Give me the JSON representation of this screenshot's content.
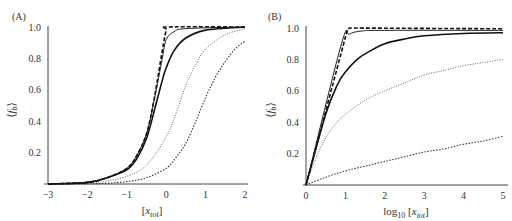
{
  "chart_data": [
    {
      "type": "line",
      "panel_label": "(A)",
      "xlabel": "[x_tot]",
      "ylabel": "⟨f_b⟩",
      "xlim": [
        -3,
        2
      ],
      "ylim": [
        0,
        1.0
      ],
      "xticks": [
        "−3",
        "−2",
        "−1",
        "0",
        "1",
        "2"
      ],
      "yticks": [
        "0.2",
        "0.4",
        "0.6",
        "0.8",
        "1.0"
      ],
      "grid": false,
      "legend": null,
      "series": [
        {
          "name": "dashed (limit)",
          "style": "dashed-thick",
          "x": [
            -3,
            -2,
            -1.5,
            -1,
            -0.75,
            -0.5,
            -0.3,
            -0.1,
            0,
            0.05,
            2
          ],
          "y": [
            0,
            0.01,
            0.04,
            0.1,
            0.18,
            0.32,
            0.55,
            0.85,
            0.98,
            1.0,
            1.0
          ]
        },
        {
          "name": "solid thin",
          "style": "solid-thin",
          "x": [
            -3,
            -2,
            -1.5,
            -1,
            -0.75,
            -0.5,
            -0.3,
            -0.1,
            0,
            0.2,
            0.5,
            2
          ],
          "y": [
            0,
            0.01,
            0.04,
            0.1,
            0.18,
            0.32,
            0.54,
            0.8,
            0.92,
            0.97,
            0.99,
            1.0
          ]
        },
        {
          "name": "solid thick",
          "style": "solid-thick",
          "x": [
            -3,
            -2,
            -1.5,
            -1,
            -0.75,
            -0.5,
            -0.3,
            -0.1,
            0,
            0.2,
            0.5,
            1,
            2
          ],
          "y": [
            0,
            0.01,
            0.04,
            0.09,
            0.16,
            0.29,
            0.47,
            0.66,
            0.74,
            0.85,
            0.93,
            0.98,
            1.0
          ]
        },
        {
          "name": "dotted",
          "style": "dotted",
          "x": [
            -3,
            -2,
            -1.5,
            -1,
            -0.5,
            0,
            0.25,
            0.5,
            0.75,
            1,
            1.5,
            2
          ],
          "y": [
            0,
            0.005,
            0.02,
            0.05,
            0.12,
            0.3,
            0.45,
            0.63,
            0.76,
            0.86,
            0.95,
            0.99
          ]
        },
        {
          "name": "dotted thick",
          "style": "dotted-thick",
          "x": [
            -3,
            -2,
            -1.5,
            -1,
            -0.5,
            0,
            0.25,
            0.5,
            0.75,
            1,
            1.25,
            1.5,
            1.75,
            2
          ],
          "y": [
            0,
            0.001,
            0.005,
            0.015,
            0.04,
            0.1,
            0.17,
            0.26,
            0.4,
            0.55,
            0.68,
            0.78,
            0.86,
            0.91
          ]
        }
      ]
    },
    {
      "type": "line",
      "panel_label": "(B)",
      "xlabel": "log10 [x_tot]",
      "ylabel": "⟨f_b⟩",
      "xlim": [
        0,
        5
      ],
      "ylim": [
        0,
        1.0
      ],
      "xticks": [
        "0",
        "1",
        "2",
        "3",
        "4",
        "5"
      ],
      "yticks": [
        "0.2",
        "0.4",
        "0.6",
        "0.8",
        "1.0"
      ],
      "grid": false,
      "legend": null,
      "series": [
        {
          "name": "dashed (limit)",
          "style": "dashed-thick",
          "x": [
            0,
            1.05,
            1.1,
            5
          ],
          "y": [
            0,
            0.99,
            1.0,
            0.995
          ]
        },
        {
          "name": "solid thin",
          "style": "solid-thin",
          "x": [
            0,
            0.9,
            1.1,
            1.4,
            2,
            5
          ],
          "y": [
            0,
            0.9,
            0.96,
            0.98,
            0.985,
            0.985
          ]
        },
        {
          "name": "solid thick",
          "style": "solid-thick",
          "x": [
            0,
            0.5,
            0.8,
            1,
            1.3,
            1.6,
            2,
            2.5,
            3,
            4,
            5
          ],
          "y": [
            0,
            0.45,
            0.64,
            0.72,
            0.8,
            0.85,
            0.9,
            0.93,
            0.95,
            0.965,
            0.97
          ]
        },
        {
          "name": "dotted",
          "style": "dotted",
          "x": [
            0,
            0.25,
            0.5,
            0.75,
            1,
            1.5,
            2,
            2.5,
            3,
            3.5,
            4,
            4.5,
            5
          ],
          "y": [
            0,
            0.17,
            0.3,
            0.39,
            0.45,
            0.54,
            0.6,
            0.65,
            0.7,
            0.73,
            0.76,
            0.78,
            0.8
          ]
        },
        {
          "name": "dotted thick",
          "style": "dotted-thick",
          "x": [
            0,
            0.5,
            1,
            1.5,
            2,
            2.5,
            3,
            3.5,
            4,
            4.5,
            5
          ],
          "y": [
            0,
            0.05,
            0.09,
            0.12,
            0.15,
            0.18,
            0.21,
            0.23,
            0.26,
            0.28,
            0.31
          ]
        }
      ]
    }
  ]
}
